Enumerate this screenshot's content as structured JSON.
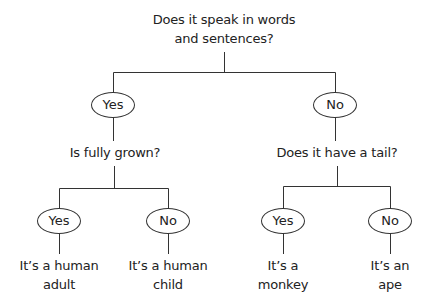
{
  "root": {
    "question_line1": "Does it speak in words",
    "question_line2": "and sentences?"
  },
  "branches": [
    {
      "answer": "Yes",
      "question": "Is fully grown?",
      "children": [
        {
          "answer": "Yes",
          "result_line1": "It’s a human",
          "result_line2": "adult"
        },
        {
          "answer": "No",
          "result_line1": "It’s a human",
          "result_line2": "child"
        }
      ]
    },
    {
      "answer": "No",
      "question": "Does it have a tail?",
      "children": [
        {
          "answer": "Yes",
          "result_line1": "It’s a",
          "result_line2": "monkey"
        },
        {
          "answer": "No",
          "result_line1": "It’s an",
          "result_line2": "ape"
        }
      ]
    }
  ],
  "colors": {
    "line": "#333333",
    "text": "#222222",
    "background": "#ffffff"
  }
}
